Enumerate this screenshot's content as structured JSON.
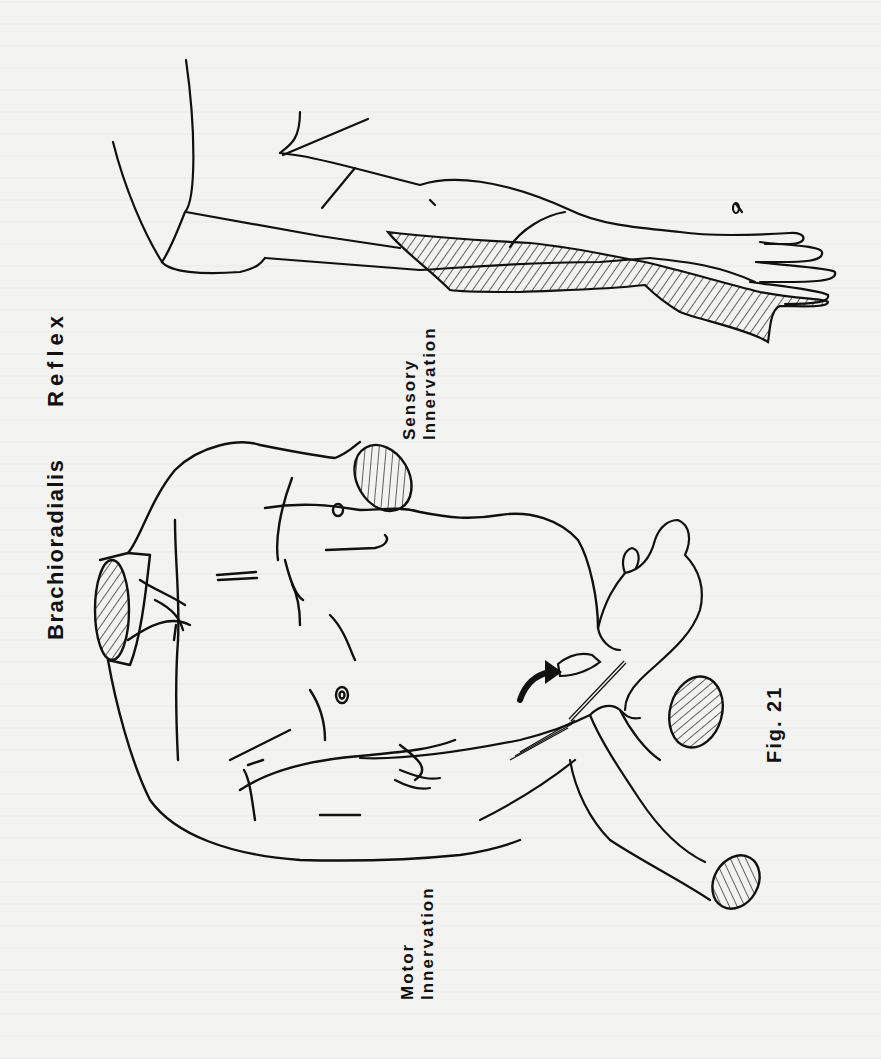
{
  "figure": {
    "number_label": "Fig. 21",
    "title_part1": "Brachioradialis",
    "title_part2": "Reflex",
    "sensory_label_line1": "Sensory",
    "sensory_label_line2": "Innervation",
    "motor_label_line1": "Motor",
    "motor_label_line2": "Innervation"
  },
  "illustrations": {
    "arm": "sensory-innervation-arm-with-hatched-radial-area",
    "torso": "patient-torso-with-examiner-hand-and-reflex-hammer",
    "arrow": "curved-arrow-pointing-to-tap-site"
  },
  "colors": {
    "ink": "#111111",
    "paper": "#f3f3f1"
  }
}
